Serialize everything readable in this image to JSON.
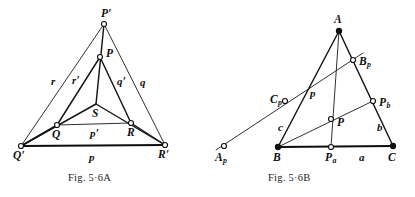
{
  "figure_a": {
    "caption": "Fig. 5·6A",
    "points": [
      {
        "id": "P-prime",
        "label": "P",
        "prime": true,
        "marker": "open",
        "x": 104,
        "y": 24,
        "lx": 101,
        "ly": 8
      },
      {
        "id": "P",
        "label": "P",
        "prime": false,
        "marker": "open",
        "x": 100,
        "y": 57,
        "lx": 106,
        "ly": 48
      },
      {
        "id": "S",
        "label": "S",
        "prime": false,
        "marker": "none",
        "x": 96,
        "y": 104,
        "lx": 92,
        "ly": 108
      },
      {
        "id": "Q",
        "label": "Q",
        "prime": false,
        "marker": "open",
        "x": 57,
        "y": 125,
        "lx": 52,
        "ly": 129
      },
      {
        "id": "R",
        "label": "R",
        "prime": false,
        "marker": "open",
        "x": 131,
        "y": 123,
        "lx": 127,
        "ly": 127
      },
      {
        "id": "Q-prime",
        "label": "Q",
        "prime": true,
        "marker": "open",
        "x": 21,
        "y": 146,
        "lx": 13,
        "ly": 150
      },
      {
        "id": "R-prime",
        "label": "R",
        "prime": true,
        "marker": "open",
        "x": 165,
        "y": 145,
        "lx": 158,
        "ly": 149
      }
    ],
    "side_labels": [
      {
        "id": "side-r",
        "label": "r",
        "prime": false,
        "lx": 51,
        "ly": 76
      },
      {
        "id": "side-r-prime",
        "label": "r",
        "prime": true,
        "lx": 72,
        "ly": 75
      },
      {
        "id": "side-q-prime",
        "label": "q",
        "prime": true,
        "lx": 117,
        "ly": 76
      },
      {
        "id": "side-q",
        "label": "q",
        "prime": false,
        "lx": 140,
        "ly": 77
      },
      {
        "id": "side-p-prime",
        "label": "p",
        "prime": true,
        "lx": 90,
        "ly": 128
      },
      {
        "id": "side-p",
        "label": "p",
        "prime": false,
        "lx": 89,
        "ly": 152
      }
    ]
  },
  "figure_b": {
    "caption": "Fig. 5·6B",
    "points": [
      {
        "id": "A",
        "label": "A",
        "sub": "",
        "marker": "solid",
        "x": 139,
        "y": 31,
        "lx": 134,
        "ly": 14
      },
      {
        "id": "B-p",
        "label": "B",
        "sub": "p",
        "marker": "open",
        "x": 153,
        "y": 60,
        "lx": 159,
        "ly": 56
      },
      {
        "id": "C-p",
        "label": "C",
        "sub": "p",
        "marker": "open",
        "x": 85,
        "y": 101,
        "lx": 70,
        "ly": 94
      },
      {
        "id": "P-b",
        "label": "P",
        "sub": "b",
        "marker": "open",
        "x": 173,
        "y": 101,
        "lx": 179,
        "ly": 97
      },
      {
        "id": "P",
        "label": "P",
        "sub": "",
        "marker": "open",
        "x": 131,
        "y": 119,
        "lx": 137,
        "ly": 117
      },
      {
        "id": "A-p",
        "label": "A",
        "sub": "p",
        "marker": "open",
        "x": 24,
        "y": 146,
        "lx": 15,
        "ly": 152
      },
      {
        "id": "B",
        "label": "B",
        "sub": "",
        "marker": "solid",
        "x": 78,
        "y": 147,
        "lx": 73,
        "ly": 152
      },
      {
        "id": "P-a",
        "label": "P",
        "sub": "a",
        "marker": "open",
        "x": 131,
        "y": 147,
        "lx": 125,
        "ly": 152
      },
      {
        "id": "C",
        "label": "C",
        "sub": "",
        "marker": "solid",
        "x": 193,
        "y": 146,
        "lx": 188,
        "ly": 152
      }
    ],
    "side_labels": [
      {
        "id": "side-p",
        "label": "p",
        "lx": 110,
        "ly": 88
      },
      {
        "id": "side-c",
        "label": "c",
        "lx": 78,
        "ly": 122
      },
      {
        "id": "side-b",
        "label": "b",
        "lx": 177,
        "ly": 122
      },
      {
        "id": "side-a",
        "label": "a",
        "lx": 159,
        "ly": 152
      }
    ]
  },
  "style": {
    "ink": "#101010",
    "paper": "#ffffff"
  }
}
